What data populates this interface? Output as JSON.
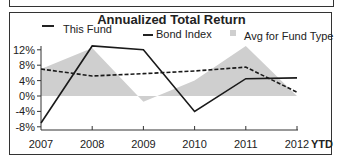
{
  "chart_data": {
    "type": "line",
    "title": "Annualized Total Return",
    "xlabel": "",
    "ylabel": "",
    "categories": [
      "2007",
      "2008",
      "2009",
      "2010",
      "2011",
      "2012"
    ],
    "x_suffix_label": "YTD",
    "yticks": [
      "12%",
      "8%",
      "4%",
      "0%",
      "-4%",
      "-8%"
    ],
    "ylim": [
      -8,
      12
    ],
    "grid": false,
    "legend_position": "top",
    "series": [
      {
        "name": "This Fund",
        "style": "solid line",
        "values": [
          -7,
          13,
          12,
          -4,
          4.5,
          4.7
        ]
      },
      {
        "name": "Bond Index",
        "style": "dashed line",
        "values": [
          7,
          5.2,
          5.8,
          6.5,
          7.5,
          1
        ]
      },
      {
        "name": "Avg for Fund Type",
        "style": "gray area",
        "values": [
          7,
          12.5,
          -1.5,
          4,
          13,
          0
        ]
      }
    ]
  },
  "legend": {
    "this_fund": "This Fund",
    "bond_index": "Bond Index",
    "avg_fund_type": "Avg for Fund Type"
  },
  "colors": {
    "area": "#cfcfcf",
    "line": "#1a1a1a"
  }
}
